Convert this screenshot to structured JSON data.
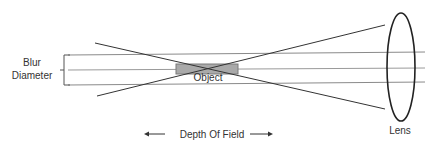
{
  "labels": {
    "blur_line1": "Blur",
    "blur_line2": "Diameter",
    "object": "Object",
    "depth_of_field": "Depth Of Field",
    "lens": "Lens"
  },
  "colors": {
    "line": "#333333",
    "guide_line": "#7a7a7a",
    "object_fill": "#a9a9a9",
    "object_stroke": "#7a7a7a",
    "text": "#333333",
    "background": "#ffffff"
  },
  "icons": {
    "left_arrow": "arrow-left-icon",
    "right_arrow": "arrow-right-icon"
  }
}
